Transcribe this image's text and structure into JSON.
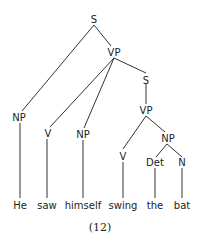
{
  "tree": {
    "nodes": {
      "s_root": "S",
      "vp_main": "VP",
      "np_subject": "NP",
      "v_saw": "V",
      "np_object": "NP",
      "s_embedded": "S",
      "vp_embedded": "VP",
      "v_swing": "V",
      "np_embedded": "NP",
      "det": "Det",
      "n": "N"
    },
    "words": [
      "He",
      "saw",
      "himself",
      "swing",
      "the",
      "bat"
    ]
  },
  "caption": "(12)"
}
